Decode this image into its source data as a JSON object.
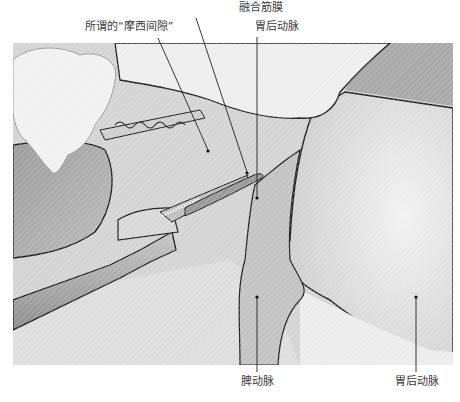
{
  "figure": {
    "type": "surgical-anatomy-illustration",
    "style": "grayscale pencil drawing with leader-line callouts",
    "labels": {
      "fusion_fascia": "融合筋膜",
      "morse_space": "所谓的“摩西间隙”",
      "posterior_gastric_artery_top": "胃后动脉",
      "splenic_artery": "脾动脉",
      "posterior_gastric_artery_bottom": "胃后动脉"
    },
    "colors": {
      "label_text": "#3a3a3a",
      "leader_line": "#222222",
      "outline": "#1e1e1e",
      "tissue_light": "#e6e6e6",
      "tissue_mid": "#c8c8c8",
      "organ_shadow": "#a8a8a8",
      "instrument": "#b4b4b4"
    }
  }
}
